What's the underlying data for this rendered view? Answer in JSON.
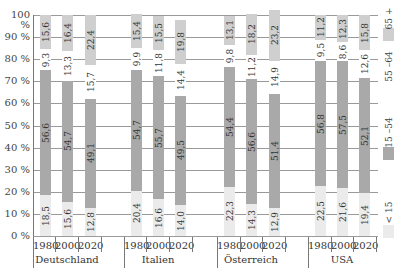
{
  "chart_data": {
    "type": "bar",
    "stacked": true,
    "orientation": "vertical",
    "title": "",
    "xlabel": "",
    "ylabel": "",
    "ylim": [
      0,
      100
    ],
    "y_ticks": [
      "0 %",
      "10 %",
      "20 %",
      "30 %",
      "40 %",
      "50 %",
      "60 %",
      "70 %",
      "80 %",
      "90 %",
      "100 %"
    ],
    "grid": true,
    "legend_position": "right",
    "groups": [
      "Deutschland",
      "Italien",
      "Österreich",
      "USA"
    ],
    "years": [
      "1980",
      "2000",
      "2020"
    ],
    "categories": [
      "Deutschland 1980",
      "Deutschland 2000",
      "Deutschland 2020",
      "Italien 1980",
      "Italien 2000",
      "Italien 2020",
      "Österreich 1980",
      "Österreich 2000",
      "Österreich 2020",
      "USA 1980",
      "USA 2000",
      "USA 2020"
    ],
    "series": [
      {
        "name": "< 15",
        "color": "#ebebeb",
        "values": [
          18.5,
          15.6,
          12.8,
          20.4,
          16.6,
          14.0,
          22.3,
          14.3,
          12.9,
          22.5,
          21.6,
          19.4
        ]
      },
      {
        "name": "15 –54",
        "color": "#a9a9a9",
        "values": [
          56.6,
          54.7,
          49.1,
          54.7,
          55.7,
          49.5,
          54.4,
          56.6,
          51.4,
          56.8,
          57.5,
          52.1
        ]
      },
      {
        "name": "55 –64",
        "color": "#ffffff",
        "values": [
          9.3,
          13.3,
          15.7,
          9.9,
          11.8,
          14.4,
          9.8,
          11.2,
          14.9,
          9.5,
          8.6,
          12.6
        ]
      },
      {
        "name": "65 +",
        "color": "#cfcfcf",
        "values": [
          15.6,
          16.4,
          22.4,
          15.4,
          15.5,
          19.8,
          13.1,
          18.2,
          23.2,
          11.2,
          12.3,
          15.8
        ]
      }
    ],
    "value_labels": [
      [
        "18,5",
        "15,6",
        "12,8",
        "20,4",
        "16,6",
        "14,0",
        "22,3",
        "14,3",
        "12,9",
        "22,5",
        "21,6",
        "19,4"
      ],
      [
        "56,6",
        "54,7",
        "49,1",
        "54,7",
        "55,7",
        "49,5",
        "54,4",
        "56,6",
        "51,4",
        "56,8",
        "57,5",
        "52,1"
      ],
      [
        "9,3",
        "13,3",
        "15,7",
        "9,9",
        "11,8",
        "14,4",
        "9,8",
        "11,2",
        "14,9",
        "9,5",
        "8,6",
        "12,6"
      ],
      [
        "15,6",
        "16,4",
        "22,4",
        "15,4",
        "15,5",
        "19,8",
        "13,1",
        "18,2",
        "23,2",
        "11,2",
        "12,3",
        "15,8"
      ]
    ]
  },
  "legend": [
    {
      "label": "65 +",
      "color": "#cfcfcf"
    },
    {
      "label": "55 –64",
      "color": "#ffffff"
    },
    {
      "label": "15 –54",
      "color": "#a9a9a9"
    },
    {
      "label": "< 15",
      "color": "#ebebeb"
    }
  ]
}
